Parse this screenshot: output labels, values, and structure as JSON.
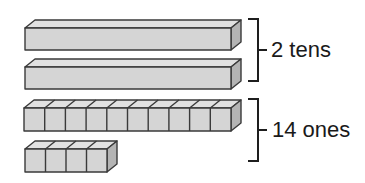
{
  "diagram": {
    "type": "base-ten-blocks",
    "groups": [
      {
        "label": "2 tens",
        "blocks": [
          {
            "kind": "ten-rod",
            "units": 10,
            "segmented": false
          },
          {
            "kind": "ten-rod",
            "units": 10,
            "segmented": false
          }
        ]
      },
      {
        "label": "14 ones",
        "blocks": [
          {
            "kind": "unit-cubes",
            "units": 10,
            "segmented": true
          },
          {
            "kind": "unit-cubes",
            "units": 4,
            "segmented": true
          }
        ]
      }
    ]
  },
  "colors": {
    "block_front": "#d5d5d5",
    "block_top": "#e1e1e1",
    "block_side": "#b4b4b4",
    "outline": "#3a3a3a",
    "text": "#1a1a1a"
  }
}
